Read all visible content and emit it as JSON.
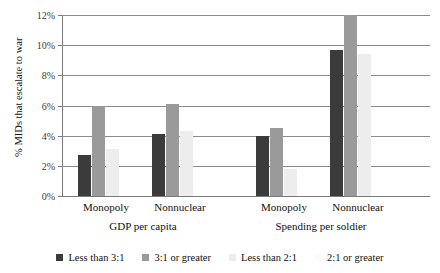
{
  "chart_data": {
    "type": "bar",
    "title": "",
    "subtitle": "",
    "xlabel": "",
    "ylabel": "% MIDs that escalate to war",
    "ylim": [
      0,
      12
    ],
    "ytick_labels": [
      "0%",
      "2%",
      "4%",
      "6%",
      "8%",
      "10%",
      "12%"
    ],
    "ytick_values": [
      0,
      2,
      4,
      6,
      8,
      10,
      12
    ],
    "grid": "horizontal",
    "legend_position": "bottom",
    "panels": [
      {
        "label": "GDP per capita"
      },
      {
        "label": "Spending per soldier"
      }
    ],
    "categories": [
      "Monopoly",
      "Nonnuclear",
      "Monopoly",
      "Nonnuclear"
    ],
    "series": [
      {
        "name": "Less than 3:1",
        "color": "#3b3b3b",
        "panel": "GDP per capita",
        "values": [
          2.7,
          4.1,
          null,
          null
        ]
      },
      {
        "name": "3:1 or greater",
        "color": "#9a9a9a",
        "panel": "GDP per capita",
        "values": [
          6.0,
          6.1,
          null,
          null
        ]
      },
      {
        "name": "Less than 2:1",
        "color": "#ededed",
        "panel": "Spending per soldier",
        "values": [
          3.1,
          4.3,
          1.8,
          9.4
        ]
      },
      {
        "name": "2:1 or greater",
        "color": "#fbfbfb",
        "panel": "Spending per soldier",
        "values": [
          null,
          null,
          null,
          null
        ]
      }
    ],
    "bar_groups": [
      {
        "category": "Monopoly",
        "panel": "GDP per capita",
        "bars": [
          {
            "series": "Less than 3:1",
            "value": 2.7,
            "color": "#3b3b3b"
          },
          {
            "series": "3:1 or greater",
            "value": 6.0,
            "color": "#9a9a9a"
          },
          {
            "series": "Less than 2:1",
            "value": 3.1,
            "color": "#ededed"
          }
        ]
      },
      {
        "category": "Nonnuclear",
        "panel": "GDP per capita",
        "bars": [
          {
            "series": "Less than 3:1",
            "value": 4.1,
            "color": "#3b3b3b"
          },
          {
            "series": "3:1 or greater",
            "value": 6.1,
            "color": "#9a9a9a"
          },
          {
            "series": "Less than 2:1",
            "value": 4.3,
            "color": "#ededed"
          }
        ]
      },
      {
        "category": "Monopoly",
        "panel": "Spending per soldier",
        "bars": [
          {
            "series": "Less than 3:1",
            "value": 4.0,
            "color": "#3b3b3b"
          },
          {
            "series": "3:1 or greater",
            "value": 4.5,
            "color": "#9a9a9a"
          },
          {
            "series": "Less than 2:1",
            "value": 1.8,
            "color": "#ededed"
          }
        ]
      },
      {
        "category": "Nonnuclear",
        "panel": "Spending per soldier",
        "bars": [
          {
            "series": "Less than 3:1",
            "value": 9.7,
            "color": "#3b3b3b"
          },
          {
            "series": "3:1 or greater",
            "value": 12.0,
            "color": "#9a9a9a"
          },
          {
            "series": "Less than 2:1",
            "value": 9.4,
            "color": "#ededed"
          }
        ]
      }
    ],
    "legend": [
      {
        "label": "Less than 3:1",
        "color": "#3b3b3b"
      },
      {
        "label": "3:1 or greater",
        "color": "#9a9a9a"
      },
      {
        "label": "Less than 2:1",
        "color": "#ededed"
      },
      {
        "label": "2:1 or greater",
        "color": "#fbfbfb"
      }
    ]
  }
}
